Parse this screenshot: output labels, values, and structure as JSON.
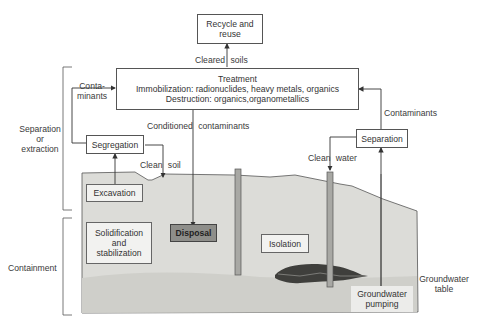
{
  "diagram": {
    "colors": {
      "soil": "#dcdcd8",
      "groundwater": "#cfcfca",
      "line": "#444444",
      "disposal_fill": "#8e8e8a",
      "well": "#a8a8a4"
    },
    "boxes": {
      "recycle": "Recycle and reuse",
      "treatment": {
        "title": "Treatment",
        "line1": "Immobilization: radionuclides, heavy metals, organics",
        "line2": "Destruction: organics,organometallics"
      },
      "segregation": "Segregation",
      "separation": "Separation",
      "excavation": "Excavation",
      "solidification": "Solidification and stabilization",
      "disposal": "Disposal",
      "isolation": "Isolation",
      "groundwater_pumping": "Groundwater pumping"
    },
    "arrow_labels": {
      "cleared_soils_a": "Cleared",
      "cleared_soils_b": "soils",
      "contaminants_left_a": "Conta-",
      "contaminants_left_b": "minants",
      "conditioned_a": "Conditioned",
      "conditioned_b": "contaminants",
      "clean_soil_a": "Clean",
      "clean_soil_b": "soil",
      "clean_water_a": "Clean",
      "clean_water_b": "water",
      "contaminants_right": "Contaminants"
    },
    "side_labels": {
      "separation_a": "Separation",
      "separation_b": "or",
      "separation_c": "extraction",
      "containment": "Containment",
      "gw_table_a": "Groundwater",
      "gw_table_b": "table"
    }
  }
}
